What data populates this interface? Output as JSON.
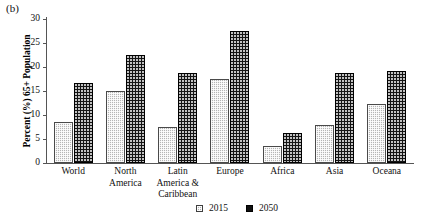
{
  "panel": {
    "label": "(b)"
  },
  "chart_data": {
    "type": "bar",
    "title": "",
    "xlabel": "",
    "ylabel": "Percent (%) 65+ Population",
    "ylim": [
      0,
      30
    ],
    "yticks": [
      0,
      5,
      10,
      15,
      20,
      25,
      30
    ],
    "ytick_labels": [
      "0",
      "5",
      "10",
      "15",
      "20",
      "25",
      "30"
    ],
    "grid": false,
    "legend_position": "bottom-center",
    "categories": [
      "World",
      "North America",
      "Latin America & Caribbean",
      "Europe",
      "Africa",
      "Asia",
      "Oceana"
    ],
    "category_lines": [
      [
        "World"
      ],
      [
        "North",
        "America"
      ],
      [
        "Latin",
        "America &",
        "Caribbean"
      ],
      [
        "Europe"
      ],
      [
        "Africa"
      ],
      [
        "Asia"
      ],
      [
        "Oceana"
      ]
    ],
    "series": [
      {
        "name": "2015",
        "color": "#b5b5b5",
        "pattern": "checkered",
        "values": [
          8.5,
          15.1,
          7.5,
          17.4,
          3.5,
          7.9,
          12.3
        ]
      },
      {
        "name": "2050",
        "color": "#141414",
        "pattern": "dotted",
        "values": [
          16.7,
          22.4,
          18.7,
          27.5,
          6.3,
          18.7,
          19.2
        ]
      }
    ]
  },
  "legend": {
    "items": [
      {
        "label": "2015",
        "swatch": "checkered-gray-swatch"
      },
      {
        "label": "2050",
        "swatch": "solid-black-swatch"
      }
    ]
  }
}
